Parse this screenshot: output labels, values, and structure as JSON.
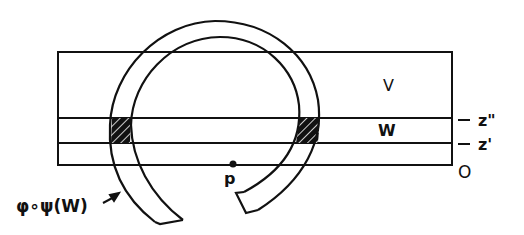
{
  "diagram": {
    "regions": {
      "V": "V",
      "W": "W"
    },
    "levels": {
      "z_double_prime": "z\"",
      "z_prime": "z'",
      "origin": "O"
    },
    "point": {
      "label": "p"
    },
    "annotation": {
      "label": "φ∘ψ(W)"
    },
    "colors": {
      "stroke": "#111111",
      "background": "#ffffff",
      "hatch_fill": "#111111"
    }
  }
}
